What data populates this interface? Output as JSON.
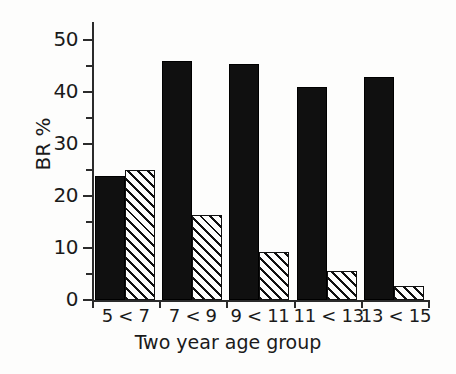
{
  "chart_data": {
    "type": "bar",
    "title": "",
    "xlabel": "Two year age group",
    "ylabel": "BR %",
    "ylim": [
      0,
      50
    ],
    "ytick_labels": [
      "0",
      "10",
      "20",
      "30",
      "40",
      "50"
    ],
    "ytick_values": [
      0,
      10,
      20,
      30,
      40,
      50
    ],
    "yminor_values": [
      5,
      15,
      25,
      35,
      45
    ],
    "grid": false,
    "legend": "none",
    "categories": [
      "5 < 7",
      "7 < 9",
      "9 < 11",
      "11 < 13",
      "13 < 15"
    ],
    "series": [
      {
        "name": "solid",
        "fill": "solid-black",
        "color": "#101010",
        "values": [
          23.8,
          46.0,
          45.3,
          41.0,
          42.9
        ]
      },
      {
        "name": "hatched",
        "fill": "diagonal-hatch",
        "color": "#ffffff",
        "values": [
          25.0,
          16.3,
          9.3,
          5.6,
          2.7
        ]
      }
    ]
  },
  "axes": {
    "y_title": "BR %",
    "x_title": "Two year age group"
  }
}
